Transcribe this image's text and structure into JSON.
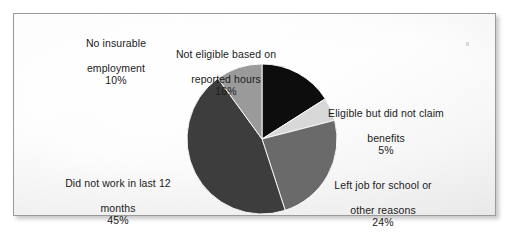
{
  "figure": {
    "title": "",
    "background_color": "#fafafa",
    "border_color": "#9a9a9a"
  },
  "chart_data": {
    "type": "pie",
    "title": "",
    "xlabel": "",
    "ylabel": "",
    "legend_position": "none",
    "grid": false,
    "units": "percent",
    "start_angle_deg": 0,
    "direction": "clockwise",
    "categories": [
      "Not eligible based on reported hours",
      "Eligible but did not claim benefits",
      "Left job for school or other reasons",
      "Did not work in last 12 months",
      "No insurable employment"
    ],
    "values": [
      16,
      5,
      24,
      45,
      10
    ],
    "value_labels": [
      "16%",
      "5%",
      "24%",
      "45%",
      "10%"
    ],
    "colors": [
      "#0d0d0d",
      "#d8d8d8",
      "#6a6a6a",
      "#3d3d3d",
      "#9a9a9a"
    ],
    "slices": [
      {
        "label": "Not eligible based on reported hours",
        "label_line_1": "Not eligible based on",
        "label_line_2": "reported hours",
        "value": 16,
        "value_label": "16%",
        "color": "#0d0d0d"
      },
      {
        "label": "Eligible but did not claim benefits",
        "label_line_1": "Eligible but did not claim",
        "label_line_2": "benefits",
        "value": 5,
        "value_label": "5%",
        "color": "#d8d8d8"
      },
      {
        "label": "Left job for school or other reasons",
        "label_line_1": "Left job for school or",
        "label_line_2": "other reasons",
        "value": 24,
        "value_label": "24%",
        "color": "#6a6a6a"
      },
      {
        "label": "Did not work in last 12 months",
        "label_line_1": "Did not work in last 12",
        "label_line_2": "months",
        "value": 45,
        "value_label": "45%",
        "color": "#3d3d3d"
      },
      {
        "label": "No insurable employment",
        "label_line_1": "No insurable",
        "label_line_2": "employment",
        "value": 10,
        "value_label": "10%",
        "color": "#9a9a9a"
      }
    ]
  }
}
